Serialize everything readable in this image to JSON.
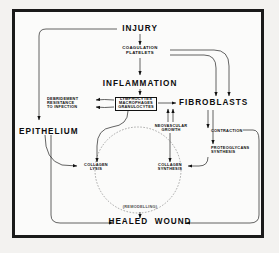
{
  "diagram": {
    "type": "flowchart",
    "nodes": {
      "injury": "INJURY",
      "coagulation": "COAGULATION\nPLATELETS",
      "inflammation": "INFLAMMATION",
      "cells": "LYMPHOCYTES\nMACROPHAGES\nGRANULOCYTES",
      "debridement": "DEBRIDEMENT\nRESISTANCE\nTO INFECTION",
      "fibroblasts": "FIBROBLASTS",
      "neovascular": "NEOVASCULAR\nGROWTH",
      "contraction": "CONTRACTION",
      "proteoglycans": "PROTEOGLYCANS\nSYNTHESIS",
      "epithelium": "EPITHELIUM",
      "collagen_lysis": "COLLAGEN\nLYSIS",
      "collagen_synthesis": "COLLAGEN\nSYNTHESIS",
      "remodelling": "(REMODELLING)",
      "healed_wound": "HEALED  WOUND"
    },
    "colors": {
      "frame": "#1a1a1a",
      "line": "#111111",
      "text": "#0d0d0d",
      "background": "#fbfbfa",
      "mat": "#f3f2f0"
    }
  }
}
